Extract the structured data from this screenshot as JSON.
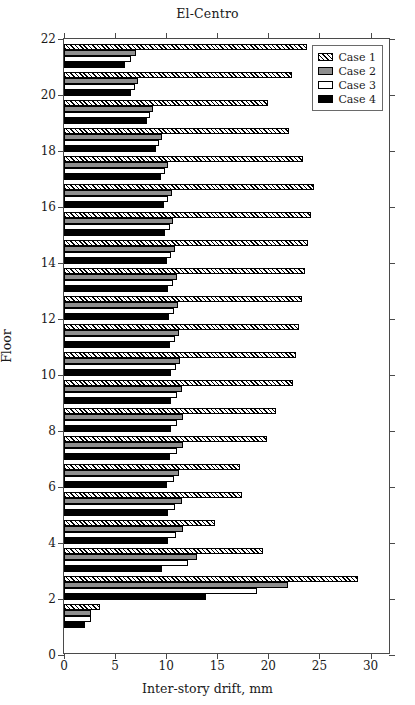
{
  "chart_data": {
    "type": "bar",
    "orientation": "horizontal",
    "title": "El-Centro",
    "xlabel": "Inter-story drift, mm",
    "ylabel": "Floor",
    "xlim": [
      0,
      32
    ],
    "ylim": [
      0,
      22
    ],
    "xticks": [
      0,
      5,
      10,
      15,
      20,
      25,
      30
    ],
    "yticks": [
      0,
      2,
      4,
      6,
      8,
      10,
      12,
      14,
      16,
      18,
      20,
      22
    ],
    "grid": false,
    "legend_position": "top-right",
    "categories": [
      1,
      2,
      3,
      4,
      5,
      6,
      7,
      8,
      9,
      10,
      11,
      12,
      13,
      14,
      15,
      16,
      17,
      18,
      19,
      20,
      21
    ],
    "series": [
      {
        "name": "Case 1",
        "style": "hatched",
        "color": "#ffffff",
        "values": [
          3.5,
          28.8,
          19.5,
          14.8,
          17.4,
          17.2,
          19.9,
          20.7,
          22.4,
          22.7,
          23.0,
          23.3,
          23.6,
          23.9,
          24.2,
          24.5,
          23.4,
          22.0,
          20.0,
          22.3,
          23.8
        ]
      },
      {
        "name": "Case 2",
        "style": "gray",
        "color": "#8e8e8e",
        "values": [
          2.6,
          21.9,
          13.0,
          11.6,
          11.5,
          11.3,
          11.6,
          11.6,
          11.5,
          11.4,
          11.3,
          11.2,
          11.1,
          10.9,
          10.7,
          10.6,
          10.2,
          9.6,
          8.7,
          7.2,
          7.0
        ]
      },
      {
        "name": "Case 3",
        "style": "white",
        "color": "#ffffff",
        "values": [
          2.6,
          18.9,
          12.1,
          11.0,
          10.9,
          10.8,
          11.1,
          11.1,
          11.1,
          11.0,
          10.9,
          10.8,
          10.7,
          10.5,
          10.4,
          10.2,
          9.9,
          9.3,
          8.4,
          6.9,
          6.6
        ]
      },
      {
        "name": "Case 4",
        "style": "black",
        "color": "#000000",
        "values": [
          2.1,
          13.9,
          9.6,
          10.2,
          10.2,
          10.1,
          10.4,
          10.5,
          10.5,
          10.5,
          10.4,
          10.3,
          10.2,
          10.1,
          9.9,
          9.8,
          9.5,
          9.0,
          8.1,
          6.6,
          6.0
        ]
      }
    ]
  },
  "legend": {
    "items": [
      {
        "label": "Case 1"
      },
      {
        "label": "Case 2"
      },
      {
        "label": "Case 3"
      },
      {
        "label": "Case 4"
      }
    ]
  }
}
